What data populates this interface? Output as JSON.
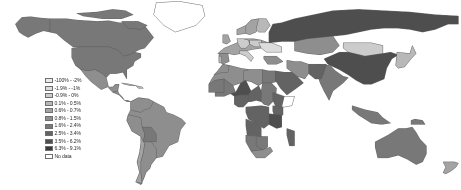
{
  "figure": {
    "type": "choropleth-world-map",
    "background_color": "#ffffff",
    "ocean_color": "#ffffff",
    "border_color": "#5a5a5a",
    "projection": "equirectangular"
  },
  "legend": {
    "title": "",
    "nodata_label": "No data",
    "nodata_color": "#ffffff",
    "entries": [
      {
        "label": "-100% - -2%",
        "color": "#ebebeb"
      },
      {
        "label": "-1.9% - -1%",
        "color": "#dcdcdc"
      },
      {
        "label": "-0.9% - 0%",
        "color": "#cccccc"
      },
      {
        "label": "0.1% - 0.5%",
        "color": "#b8b8b8"
      },
      {
        "label": "0.6% - 0.7%",
        "color": "#a3a3a3"
      },
      {
        "label": "0.8% - 1.5%",
        "color": "#8e8e8e"
      },
      {
        "label": "1.6% - 2.4%",
        "color": "#787878"
      },
      {
        "label": "2.5% - 3.4%",
        "color": "#636363"
      },
      {
        "label": "3.5% - 6.2%",
        "color": "#4e4e4e"
      },
      {
        "label": "6.3% - 9.1%",
        "color": "#3a3a3a"
      },
      {
        "label": "No data",
        "color": "#ffffff"
      }
    ]
  },
  "chart_data": {
    "type": "heatmap",
    "title": "",
    "xlabel": "",
    "ylabel": "",
    "colormap": "grayscale-sequential",
    "bins": [
      "-100% - -2%",
      "-1.9% - -1%",
      "-0.9% - 0%",
      "0.1% - 0.5%",
      "0.6% - 0.7%",
      "0.8% - 1.5%",
      "1.6% - 2.4%",
      "2.5% - 3.4%",
      "3.5% - 6.2%",
      "6.3% - 9.1%",
      "No data"
    ],
    "regions": [
      {
        "name": "Canada",
        "bin": "1.6% - 2.4%"
      },
      {
        "name": "United States",
        "bin": "1.6% - 2.4%"
      },
      {
        "name": "Greenland",
        "bin": "No data"
      },
      {
        "name": "Mexico",
        "bin": "0.8% - 1.5%"
      },
      {
        "name": "Cuba",
        "bin": "0.1% - 0.5%"
      },
      {
        "name": "Guatemala",
        "bin": "0.8% - 1.5%"
      },
      {
        "name": "Honduras",
        "bin": "0.8% - 1.5%"
      },
      {
        "name": "Nicaragua",
        "bin": "0.8% - 1.5%"
      },
      {
        "name": "Costa Rica",
        "bin": "0.8% - 1.5%"
      },
      {
        "name": "Panama",
        "bin": "0.8% - 1.5%"
      },
      {
        "name": "Colombia",
        "bin": "0.8% - 1.5%"
      },
      {
        "name": "Venezuela",
        "bin": "0.8% - 1.5%"
      },
      {
        "name": "Brazil",
        "bin": "0.8% - 1.5%"
      },
      {
        "name": "Peru",
        "bin": "0.8% - 1.5%"
      },
      {
        "name": "Bolivia",
        "bin": "1.6% - 2.4%"
      },
      {
        "name": "Chile",
        "bin": "0.6% - 0.7%"
      },
      {
        "name": "Argentina",
        "bin": "0.8% - 1.5%"
      },
      {
        "name": "Paraguay",
        "bin": "1.6% - 2.4%"
      },
      {
        "name": "Uruguay",
        "bin": "0.1% - 0.5%"
      },
      {
        "name": "United Kingdom",
        "bin": "0.6% - 0.7%"
      },
      {
        "name": "France",
        "bin": "0.6% - 0.7%"
      },
      {
        "name": "Spain",
        "bin": "0.8% - 1.5%"
      },
      {
        "name": "Portugal",
        "bin": "0.1% - 0.5%"
      },
      {
        "name": "Germany",
        "bin": "-0.9% - 0%"
      },
      {
        "name": "Poland",
        "bin": "-0.9% - 0%"
      },
      {
        "name": "Italy",
        "bin": "-0.9% - 0%"
      },
      {
        "name": "Norway",
        "bin": "0.6% - 0.7%"
      },
      {
        "name": "Sweden",
        "bin": "0.6% - 0.7%"
      },
      {
        "name": "Finland",
        "bin": "0.1% - 0.5%"
      },
      {
        "name": "Ukraine",
        "bin": "-1.9% - -1%"
      },
      {
        "name": "Russia",
        "bin": "3.5% - 6.2%"
      },
      {
        "name": "Kazakhstan",
        "bin": "0.8% - 1.5%"
      },
      {
        "name": "Mongolia",
        "bin": "-0.9% - 0%"
      },
      {
        "name": "China",
        "bin": "3.5% - 6.2%"
      },
      {
        "name": "Japan",
        "bin": "0.1% - 0.5%"
      },
      {
        "name": "India",
        "bin": "1.6% - 2.4%"
      },
      {
        "name": "Pakistan",
        "bin": "2.5% - 3.4%"
      },
      {
        "name": "Iran",
        "bin": "0.8% - 1.5%"
      },
      {
        "name": "Saudi Arabia",
        "bin": "2.5% - 3.4%"
      },
      {
        "name": "Turkey",
        "bin": "0.8% - 1.5%"
      },
      {
        "name": "Indonesia",
        "bin": "1.6% - 2.4%"
      },
      {
        "name": "Australia",
        "bin": "1.6% - 2.4%"
      },
      {
        "name": "New Zealand",
        "bin": "0.6% - 0.7%"
      },
      {
        "name": "Egypt",
        "bin": "1.6% - 2.4%"
      },
      {
        "name": "Libya",
        "bin": "0.8% - 1.5%"
      },
      {
        "name": "Algeria",
        "bin": "0.8% - 1.5%"
      },
      {
        "name": "Morocco",
        "bin": "0.8% - 1.5%"
      },
      {
        "name": "Nigeria",
        "bin": "2.5% - 3.4%"
      },
      {
        "name": "Ethiopia",
        "bin": "2.5% - 3.4%"
      },
      {
        "name": "Kenya",
        "bin": "2.5% - 3.4%"
      },
      {
        "name": "Tanzania",
        "bin": "3.5% - 6.2%"
      },
      {
        "name": "DR Congo",
        "bin": "2.5% - 3.4%"
      },
      {
        "name": "Angola",
        "bin": "2.5% - 3.4%"
      },
      {
        "name": "South Africa",
        "bin": "0.8% - 1.5%"
      },
      {
        "name": "Namibia",
        "bin": "1.6% - 2.4%"
      },
      {
        "name": "Botswana",
        "bin": "1.6% - 2.4%"
      },
      {
        "name": "Madagascar",
        "bin": "2.5% - 3.4%"
      },
      {
        "name": "Sudan",
        "bin": "1.6% - 2.4%"
      },
      {
        "name": "Chad",
        "bin": "2.5% - 3.4%"
      },
      {
        "name": "Niger",
        "bin": "3.5% - 6.2%"
      },
      {
        "name": "Mali",
        "bin": "1.6% - 2.4%"
      },
      {
        "name": "Mauritania",
        "bin": "1.6% - 2.4%"
      },
      {
        "name": "Somalia",
        "bin": "No data"
      },
      {
        "name": "Antarctica",
        "bin": "No data"
      }
    ]
  }
}
